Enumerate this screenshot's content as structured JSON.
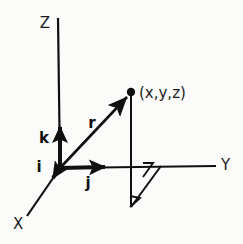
{
  "figure": {
    "kind": "3d-cartesian-coordinate-diagram",
    "background_color": "#fbfbfa",
    "ink_color": "#101010",
    "width": 243,
    "height": 244
  },
  "axes": [
    {
      "key": "z",
      "label": "Z",
      "label_x": 45,
      "label_y": 28,
      "from": [
        60,
        168
      ],
      "to": [
        58,
        18
      ],
      "stroke": 2.2
    },
    {
      "key": "y",
      "label": "Y",
      "label_x": 221,
      "label_y": 170,
      "from": [
        60,
        168
      ],
      "to": [
        216,
        166
      ],
      "stroke": 2.2
    },
    {
      "key": "x",
      "label": "X",
      "label_x": 13,
      "label_y": 229,
      "from": [
        60,
        168
      ],
      "to": [
        27,
        216
      ],
      "stroke": 2.2
    }
  ],
  "unit_vectors": [
    {
      "key": "k",
      "label": "k",
      "label_x": 44,
      "label_y": 143,
      "from": [
        60,
        168
      ],
      "to": [
        60,
        121
      ],
      "stroke": 4.0
    },
    {
      "key": "j",
      "label": "j",
      "label_x": 86,
      "label_y": 188,
      "from": [
        60,
        168
      ],
      "to": [
        111,
        167
      ],
      "stroke": 4.0
    },
    {
      "key": "i",
      "label": "i",
      "label_x": 38,
      "label_y": 172,
      "from": [
        60,
        168
      ],
      "to": [
        51,
        182
      ],
      "stroke": 4.0
    }
  ],
  "position_vector": {
    "key": "r",
    "label": "r",
    "label_x": 92,
    "label_y": 128,
    "from": [
      60,
      168
    ],
    "to": [
      130,
      94
    ],
    "stroke": 2.6
  },
  "point": {
    "label": "(x,y,z)",
    "label_x": 139,
    "label_y": 98,
    "x": 131,
    "y": 92,
    "radius": 4.2
  },
  "projection": {
    "drop_line": {
      "from": [
        131,
        92
      ],
      "to": [
        131,
        207
      ],
      "stroke": 2.0
    },
    "base_line": {
      "from": [
        131,
        207
      ],
      "to": [
        161,
        166
      ],
      "stroke": 2.0
    },
    "right_angle_marks": [
      {
        "key": "upper",
        "points": "143,177 153,163 143,163"
      },
      {
        "key": "lower",
        "points": "131,197 141,197 131,207"
      }
    ]
  }
}
